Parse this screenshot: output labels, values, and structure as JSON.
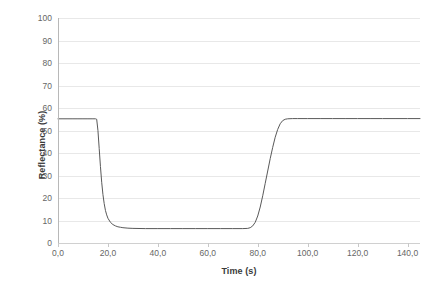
{
  "chart_data": {
    "type": "line",
    "title": "",
    "xlabel": "Time (s)",
    "ylabel": "Reflectance (%)",
    "xlim": [
      0,
      145
    ],
    "ylim": [
      0,
      100
    ],
    "grid": true,
    "legend": false,
    "x_tick_labels": [
      "0,0",
      "20,0",
      "40,0",
      "60,0",
      "80,0",
      "100,0",
      "120,0",
      "140,0"
    ],
    "x_tick_values": [
      0,
      20,
      40,
      60,
      80,
      100,
      120,
      140
    ],
    "y_tick_labels": [
      "100",
      "90",
      "80",
      "70",
      "60",
      "50",
      "40",
      "30",
      "20",
      "10",
      "0"
    ],
    "y_tick_values": [
      100,
      90,
      80,
      70,
      60,
      50,
      40,
      30,
      20,
      10,
      0
    ],
    "line_color": "#595959",
    "grid_color": "#e8e8e8",
    "series": [
      {
        "name": "Reflectance",
        "x": [
          0,
          2,
          4,
          6,
          8,
          10,
          12,
          14,
          15,
          15.5,
          16,
          16.5,
          17,
          17.5,
          18,
          18.5,
          19,
          19.5,
          20,
          21,
          22,
          23,
          24,
          25,
          26,
          28,
          30,
          35,
          40,
          45,
          50,
          55,
          60,
          65,
          70,
          74,
          76,
          77,
          78,
          79,
          80,
          81,
          82,
          83,
          84,
          85,
          86,
          87,
          88,
          89,
          90,
          91,
          92,
          94,
          96,
          100,
          105,
          110,
          115,
          120,
          125,
          130,
          135,
          140,
          145
        ],
        "y": [
          55.2,
          55.2,
          55.2,
          55.2,
          55.2,
          55.2,
          55.2,
          55.2,
          55.2,
          55.0,
          50.0,
          42.0,
          34.0,
          27.0,
          21.5,
          17.5,
          14.5,
          12.5,
          11.0,
          9.2,
          8.2,
          7.6,
          7.2,
          7.0,
          6.8,
          6.6,
          6.5,
          6.4,
          6.4,
          6.4,
          6.4,
          6.4,
          6.4,
          6.4,
          6.4,
          6.4,
          6.5,
          6.8,
          7.6,
          9.2,
          12.0,
          16.0,
          21.0,
          26.5,
          32.0,
          37.5,
          42.5,
          47.0,
          50.5,
          53.0,
          54.4,
          55.0,
          55.2,
          55.3,
          55.3,
          55.3,
          55.3,
          55.3,
          55.3,
          55.3,
          55.3,
          55.3,
          55.3,
          55.3,
          55.3
        ]
      }
    ]
  }
}
